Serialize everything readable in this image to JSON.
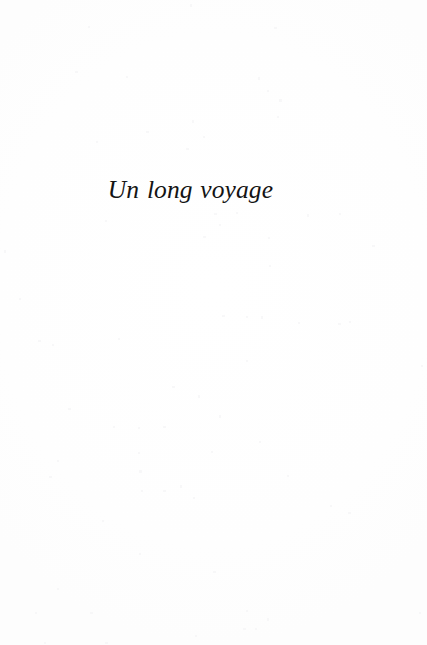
{
  "document": {
    "kind": "scanned-book-page",
    "page_role": "part-title",
    "language": "fr",
    "page_background_color": "#ffffff",
    "ink_color": "#141414"
  },
  "content": {
    "part_title": "Un long voyage"
  },
  "body": {
    "text": ""
  },
  "footer": {
    "folio": ""
  }
}
